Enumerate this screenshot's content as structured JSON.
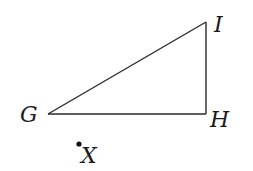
{
  "figure": {
    "type": "right triangle with external point",
    "vertices": [
      {
        "id": "G",
        "label": "G"
      },
      {
        "id": "H",
        "label": "H"
      },
      {
        "id": "I",
        "label": "I"
      }
    ],
    "edges": [
      {
        "from": "G",
        "to": "H"
      },
      {
        "from": "H",
        "to": "I"
      },
      {
        "from": "I",
        "to": "G"
      }
    ],
    "right_angle_at": "H",
    "external_point": {
      "id": "X",
      "label": "X"
    }
  }
}
